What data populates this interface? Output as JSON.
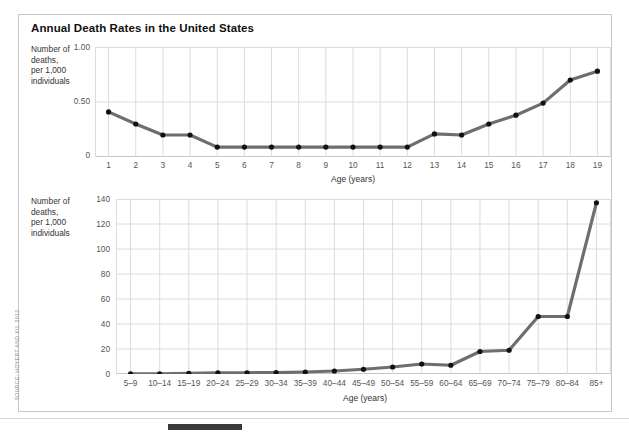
{
  "figure": {
    "title": "Annual Death Rates in the United States",
    "source_note": "SOURCE: HOYERT AND XU, 2012"
  },
  "chart_data": [
    {
      "type": "line",
      "id": "top-panel",
      "title": "Annual Death Rates in the United States",
      "xlabel": "Age (years)",
      "ylabel": "Number of\ndeaths,\nper 1,000\nindividuals",
      "categories": [
        "1",
        "2",
        "3",
        "4",
        "5",
        "6",
        "7",
        "8",
        "9",
        "10",
        "11",
        "12",
        "13",
        "14",
        "15",
        "16",
        "17",
        "18",
        "19"
      ],
      "values": [
        0.41,
        0.3,
        0.2,
        0.2,
        0.09,
        0.09,
        0.09,
        0.09,
        0.09,
        0.09,
        0.09,
        0.09,
        0.21,
        0.2,
        0.3,
        0.38,
        0.49,
        0.7,
        0.78
      ],
      "ylim": [
        0,
        1.0
      ],
      "yticks": [
        0,
        0.5,
        1.0
      ],
      "ytick_labels": [
        "0",
        "0.50",
        "1.00"
      ],
      "grid": true,
      "legend": "none",
      "line_color": "#6e6e6e",
      "marker_color": "#111111"
    },
    {
      "type": "line",
      "id": "bottom-panel",
      "xlabel": "Age (years)",
      "ylabel": "Number of\ndeaths,\nper 1,000\nindividuals",
      "categories": [
        "5–9",
        "10–14",
        "15–19",
        "20–24",
        "25–29",
        "30–34",
        "35–39",
        "40–44",
        "45–49",
        "50–54",
        "55–59",
        "60–64",
        "65–69",
        "70–74",
        "75–79",
        "80–84",
        "85+"
      ],
      "values": [
        0.1,
        0.2,
        0.6,
        0.9,
        1.0,
        1.1,
        1.6,
        2.4,
        3.8,
        5.6,
        8.0,
        7.0,
        18.0,
        19.0,
        46.0,
        46.0,
        137.0
      ],
      "ylim": [
        0,
        140
      ],
      "yticks": [
        0,
        20,
        40,
        60,
        80,
        100,
        120,
        140
      ],
      "ytick_labels": [
        "0",
        "20",
        "40",
        "60",
        "80",
        "100",
        "120",
        "140"
      ],
      "grid": true,
      "legend": "none",
      "line_color": "#6e6e6e",
      "marker_color": "#111111"
    }
  ]
}
